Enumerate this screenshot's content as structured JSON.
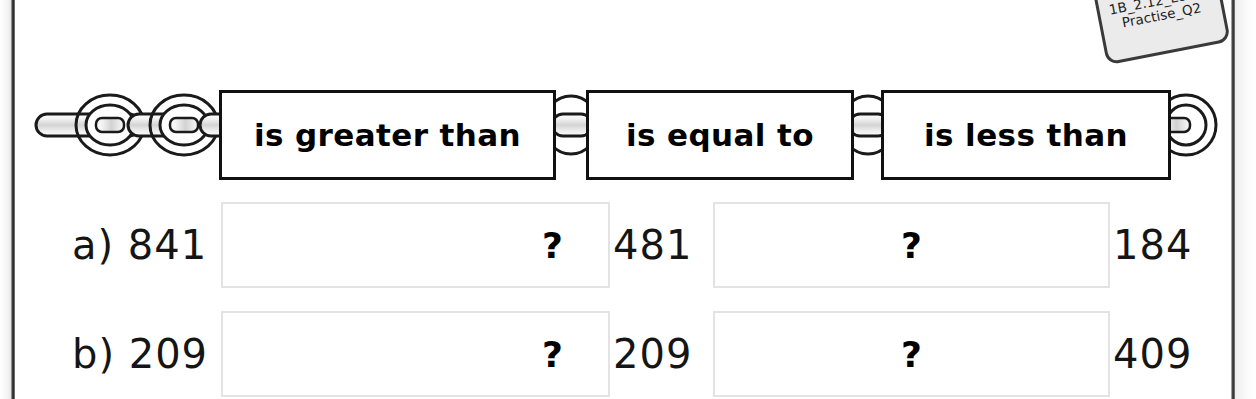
{
  "sticker": {
    "label": "Resource 1B_2.12_Let's_Practise_Q2"
  },
  "comparison_bar": {
    "phrases": [
      {
        "label": "is greater than"
      },
      {
        "label": "is equal to"
      },
      {
        "label": "is less than"
      }
    ]
  },
  "questions": [
    {
      "label": "a) 841",
      "letter": "a)",
      "first_number": "841",
      "answer_1": "?",
      "middle_number": "481",
      "answer_2": "?",
      "last_number": "184"
    },
    {
      "label": "b) 209",
      "letter": "b)",
      "first_number": "209",
      "answer_1": "?",
      "middle_number": "209",
      "answer_2": "?",
      "last_number": "409"
    }
  ],
  "colors": {
    "ink": "#111111",
    "answer_box_border": "#e3e3e3",
    "chain_fill": "#e8e8e8",
    "page_edge": "#333333"
  }
}
